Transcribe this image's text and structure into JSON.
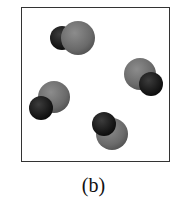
{
  "figure": {
    "label": "(b)",
    "box": {
      "x": 21,
      "y": 7,
      "width": 149,
      "height": 155,
      "stroke": "#333333"
    },
    "colors": {
      "large_atom": "#6e6e6e",
      "large_atom_highlight": "#8a8a8a",
      "small_atom": "#1a1a1a",
      "small_atom_highlight": "#3a3a3a"
    },
    "molecules": [
      {
        "name": "molecule-1",
        "small_atom": {
          "cx": 62,
          "cy": 38,
          "r": 12
        },
        "large_atom": {
          "cx": 78,
          "cy": 38,
          "r": 17
        },
        "front": "large"
      },
      {
        "name": "molecule-2",
        "large_atom": {
          "cx": 140,
          "cy": 74,
          "r": 16
        },
        "small_atom": {
          "cx": 151,
          "cy": 84,
          "r": 12
        },
        "front": "small"
      },
      {
        "name": "molecule-3",
        "large_atom": {
          "cx": 54,
          "cy": 97,
          "r": 16
        },
        "small_atom": {
          "cx": 41,
          "cy": 108,
          "r": 12
        },
        "front": "small"
      },
      {
        "name": "molecule-4",
        "large_atom": {
          "cx": 112,
          "cy": 134,
          "r": 16
        },
        "small_atom": {
          "cx": 104,
          "cy": 124,
          "r": 12
        },
        "front": "small"
      }
    ]
  }
}
